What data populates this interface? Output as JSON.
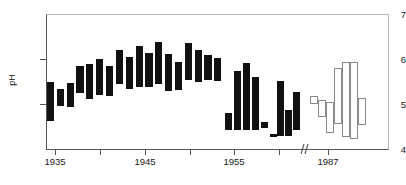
{
  "chart_data": {
    "type": "bar",
    "title": "",
    "subtitle": "",
    "xlabel": "",
    "ylabel": "pH",
    "ylim": [
      4,
      7
    ],
    "xlim": [
      1933.0,
      1962.0
    ],
    "grid": false,
    "legend": null,
    "yticks": [
      4,
      5,
      6,
      7
    ],
    "ytick_labels": [
      "4",
      "5",
      "6",
      "7"
    ],
    "xticks": [
      1935,
      1940,
      1945,
      1950,
      1955,
      1960,
      1987
    ],
    "xtick_labels_visible": [
      "1935",
      "1945",
      "1955",
      "1987"
    ],
    "axis_break": {
      "present": true,
      "between": [
        1962.5,
        1984.0
      ]
    },
    "series": [
      {
        "name": "historical-ph-range",
        "style": "filled",
        "color": "#111111",
        "bars": [
          {
            "x": 1934.5,
            "low": 4.65,
            "high": 5.5
          },
          {
            "x": 1935.6,
            "low": 4.98,
            "high": 5.35
          },
          {
            "x": 1936.7,
            "low": 4.95,
            "high": 5.48
          },
          {
            "x": 1937.8,
            "low": 5.25,
            "high": 5.85
          },
          {
            "x": 1938.9,
            "low": 5.12,
            "high": 5.9
          },
          {
            "x": 1940.0,
            "low": 5.22,
            "high": 6.0
          },
          {
            "x": 1941.1,
            "low": 5.2,
            "high": 5.85
          },
          {
            "x": 1942.2,
            "low": 5.45,
            "high": 6.2
          },
          {
            "x": 1943.3,
            "low": 5.35,
            "high": 6.05
          },
          {
            "x": 1944.4,
            "low": 5.4,
            "high": 6.3
          },
          {
            "x": 1945.5,
            "low": 5.38,
            "high": 6.15
          },
          {
            "x": 1946.6,
            "low": 5.45,
            "high": 6.38
          },
          {
            "x": 1947.7,
            "low": 5.3,
            "high": 6.12
          },
          {
            "x": 1948.8,
            "low": 5.32,
            "high": 5.95
          },
          {
            "x": 1949.9,
            "low": 5.55,
            "high": 6.35
          },
          {
            "x": 1951.0,
            "low": 5.5,
            "high": 6.2
          },
          {
            "x": 1952.1,
            "low": 5.55,
            "high": 6.1
          },
          {
            "x": 1953.2,
            "low": 5.52,
            "high": 6.02
          },
          {
            "x": 1954.4,
            "low": 4.45,
            "high": 4.82
          },
          {
            "x": 1955.4,
            "low": 4.45,
            "high": 5.75
          },
          {
            "x": 1956.4,
            "low": 4.45,
            "high": 5.92
          },
          {
            "x": 1957.4,
            "low": 4.45,
            "high": 5.62
          },
          {
            "x": 1958.4,
            "low": 4.48,
            "high": 4.62
          },
          {
            "x": 1959.4,
            "low": 4.28,
            "high": 4.35
          },
          {
            "x": 1960.2,
            "low": 4.3,
            "high": 5.52
          },
          {
            "x": 1961.1,
            "low": 4.3,
            "high": 4.88
          },
          {
            "x": 1962.0,
            "low": 4.45,
            "high": 5.28
          }
        ]
      },
      {
        "name": "recent-ph-range",
        "style": "open",
        "color": "#ffffff",
        "edge_color": "#888888",
        "bars": [
          {
            "x": 1985.4,
            "low": 5.02,
            "high": 5.2
          },
          {
            "x": 1986.3,
            "low": 4.72,
            "high": 5.1
          },
          {
            "x": 1987.2,
            "low": 4.38,
            "high": 5.05
          },
          {
            "x": 1988.1,
            "low": 4.58,
            "high": 5.8
          },
          {
            "x": 1989.0,
            "low": 4.28,
            "high": 5.95
          },
          {
            "x": 1989.9,
            "low": 4.25,
            "high": 5.95
          },
          {
            "x": 1990.8,
            "low": 4.55,
            "high": 5.15
          }
        ]
      }
    ]
  },
  "axis": {
    "y_label": "pH",
    "y_tick_7": "7",
    "y_tick_6": "6",
    "y_tick_5": "5",
    "y_tick_4": "4",
    "x_tick_1935": "1935",
    "x_tick_1945": "1945",
    "x_tick_1955": "1955",
    "x_tick_1987": "1987"
  }
}
